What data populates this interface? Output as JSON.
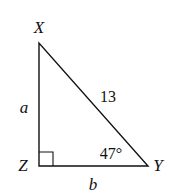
{
  "diagram": {
    "type": "right-triangle",
    "vertices": {
      "X": {
        "label": "X"
      },
      "Y": {
        "label": "Y"
      },
      "Z": {
        "label": "Z"
      }
    },
    "sides": {
      "XZ": {
        "label": "a"
      },
      "ZY": {
        "label": "b"
      },
      "XY": {
        "label": "13"
      }
    },
    "angles": {
      "Y": {
        "label": "47°"
      },
      "Z": {
        "label": "right-angle"
      }
    },
    "colors": {
      "stroke": "#111111",
      "background": "#ffffff"
    }
  }
}
